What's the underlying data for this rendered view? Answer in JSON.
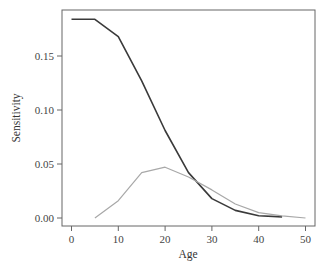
{
  "chart_data": {
    "type": "line",
    "title": "",
    "xlabel": "Age",
    "ylabel": "Sensitivity",
    "xlim": [
      -2,
      52
    ],
    "ylim": [
      -0.007,
      0.19
    ],
    "xticks": [
      0,
      10,
      20,
      30,
      40,
      50
    ],
    "xtick_labels": [
      "0",
      "10",
      "20",
      "30",
      "40",
      "50"
    ],
    "yticks": [
      0.0,
      0.05,
      0.1,
      0.15
    ],
    "ytick_labels": [
      "0.00",
      "0.05",
      "0.10",
      "0.15"
    ],
    "grid": false,
    "legend": null,
    "series": [
      {
        "name": "dark",
        "color": "#3a3a3a",
        "x": [
          0,
          5,
          10,
          15,
          20,
          25,
          30,
          35,
          40,
          45
        ],
        "values": [
          0.184,
          0.184,
          0.168,
          0.127,
          0.081,
          0.042,
          0.018,
          0.007,
          0.002,
          0.001
        ]
      },
      {
        "name": "light",
        "color": "#a8a8a8",
        "x": [
          5,
          10,
          15,
          20,
          25,
          30,
          35,
          40,
          45,
          50
        ],
        "values": [
          0.0,
          0.016,
          0.042,
          0.047,
          0.038,
          0.026,
          0.013,
          0.005,
          0.002,
          0.0
        ]
      }
    ]
  },
  "axes": {
    "xlabel": "Age",
    "ylabel": "Sensitivity"
  }
}
